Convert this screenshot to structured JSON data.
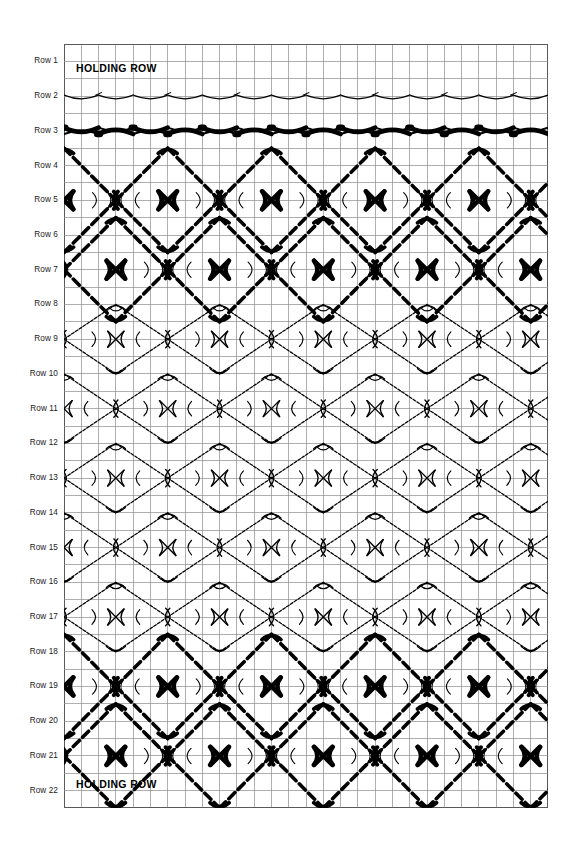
{
  "chart": {
    "kind": "knitting-stitch-chart",
    "title_note": "Lace and cable knitting chart grid",
    "grid": {
      "columns": 28,
      "rows": 44,
      "cell_width": 17.3,
      "cell_height": 17.36,
      "line_color": "#8c8c8c",
      "border_color": "#5a5a5a",
      "background": "#ffffff"
    },
    "ink_color": "#000000",
    "row_labels": [
      "Row 1",
      "Row 2",
      "Row 3",
      "Row 4",
      "Row 5",
      "Row 6",
      "Row 7",
      "Row 8",
      "Row 9",
      "Row 10",
      "Row 11",
      "Row 12",
      "Row 13",
      "Row 14",
      "Row 15",
      "Row 16",
      "Row 17",
      "Row 18",
      "Row 19",
      "Row 20",
      "Row 21",
      "Row 22"
    ],
    "annotations": [
      {
        "name": "holding-row-top",
        "text": "HOLDING ROW",
        "row": 1
      },
      {
        "name": "holding-row-bottom",
        "text": "HOLDING ROW",
        "row": 22
      }
    ]
  },
  "chart_data": {
    "type": "table",
    "xlabel": "",
    "ylabel": "",
    "categories": [
      "Row 1",
      "Row 2",
      "Row 3",
      "Row 4",
      "Row 5",
      "Row 6",
      "Row 7",
      "Row 8",
      "Row 9",
      "Row 10",
      "Row 11",
      "Row 12",
      "Row 13",
      "Row 14",
      "Row 15",
      "Row 16",
      "Row 17",
      "Row 18",
      "Row 19",
      "Row 20",
      "Row 21",
      "Row 22"
    ],
    "grid": true,
    "legend_position": "none",
    "rows": [
      {
        "label": "Row 1",
        "content": "HOLDING ROW",
        "weight": "none",
        "motif": "plain"
      },
      {
        "label": "Row 2",
        "content": "",
        "weight": "thin",
        "motif": "wave"
      },
      {
        "label": "Row 3",
        "content": "",
        "weight": "bold",
        "motif": "wave"
      },
      {
        "label": "Row 4",
        "content": "",
        "weight": "mixed",
        "motif": "diamond-top"
      },
      {
        "label": "Row 5",
        "content": "",
        "weight": "mixed",
        "motif": "diamond-upper"
      },
      {
        "label": "Row 6",
        "content": "",
        "weight": "mixed",
        "motif": "diamond-lower"
      },
      {
        "label": "Row 7",
        "content": "",
        "weight": "mixed",
        "motif": "diamond-bottom"
      },
      {
        "label": "Row 8",
        "content": "",
        "weight": "thin",
        "motif": "diamond-top"
      },
      {
        "label": "Row 9",
        "content": "",
        "weight": "thin",
        "motif": "diamond-upper"
      },
      {
        "label": "Row 10",
        "content": "",
        "weight": "thin",
        "motif": "diamond-lower"
      },
      {
        "label": "Row 11",
        "content": "",
        "weight": "thin",
        "motif": "diamond-bottom"
      },
      {
        "label": "Row 12",
        "content": "",
        "weight": "thin",
        "motif": "diamond-top"
      },
      {
        "label": "Row 13",
        "content": "",
        "weight": "thin",
        "motif": "diamond-upper"
      },
      {
        "label": "Row 14",
        "content": "",
        "weight": "thin",
        "motif": "diamond-lower"
      },
      {
        "label": "Row 15",
        "content": "",
        "weight": "thin",
        "motif": "diamond-bottom"
      },
      {
        "label": "Row 16",
        "content": "",
        "weight": "thin",
        "motif": "diamond-top"
      },
      {
        "label": "Row 17",
        "content": "",
        "weight": "thin",
        "motif": "diamond-upper"
      },
      {
        "label": "Row 18",
        "content": "",
        "weight": "mixed",
        "motif": "diamond-lower"
      },
      {
        "label": "Row 19",
        "content": "",
        "weight": "bold",
        "motif": "diamond-bottom"
      },
      {
        "label": "Row 20",
        "content": "",
        "weight": "bold",
        "motif": "diamond-top"
      },
      {
        "label": "Row 21",
        "content": "",
        "weight": "bold",
        "motif": "diamond-upper"
      },
      {
        "label": "Row 22",
        "content": "HOLDING ROW",
        "weight": "none",
        "motif": "plain"
      }
    ]
  }
}
